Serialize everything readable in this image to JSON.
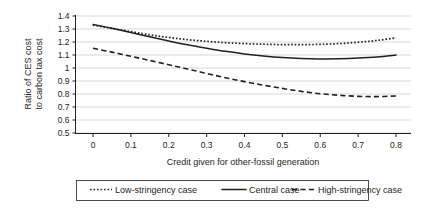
{
  "chart_data": {
    "type": "line",
    "title": "",
    "xlabel": "Credit given for other-fossil generation",
    "ylabel": "Ratio of CES cost to carbon tax cost",
    "ylabel_line1": "Ratio of CES cost",
    "ylabel_line2": "to carbon tax cost",
    "xlim": [
      0,
      0.8
    ],
    "ylim": [
      0.5,
      1.4
    ],
    "grid": true,
    "legend_position": "bottom",
    "x_ticks": [
      "0",
      "0.1",
      "0.2",
      "0.3",
      "0.4",
      "0.5",
      "0.6",
      "0.7",
      "0.8"
    ],
    "x_tick_values": [
      0,
      0.1,
      0.2,
      0.3,
      0.4,
      0.5,
      0.6,
      0.7,
      0.8
    ],
    "y_ticks": [
      "0.5",
      "0.6",
      "0.7",
      "0.8",
      "0.9",
      "1",
      "1.1",
      "1.2",
      "1.3",
      "1.4"
    ],
    "y_tick_values": [
      0.5,
      0.6,
      0.7,
      0.8,
      0.9,
      1.0,
      1.1,
      1.2,
      1.3,
      1.4
    ],
    "x": [
      0,
      0.05,
      0.1,
      0.15,
      0.2,
      0.25,
      0.3,
      0.35,
      0.4,
      0.45,
      0.5,
      0.55,
      0.6,
      0.65,
      0.7,
      0.75,
      0.8
    ],
    "series": [
      {
        "name": "Low-stringency case",
        "style": "dotted",
        "color": "#231f20",
        "values": [
          1.33,
          1.305,
          1.28,
          1.255,
          1.235,
          1.218,
          1.205,
          1.195,
          1.188,
          1.183,
          1.18,
          1.18,
          1.182,
          1.188,
          1.198,
          1.212,
          1.232
        ]
      },
      {
        "name": "Central case",
        "style": "solid",
        "color": "#231f20",
        "values": [
          1.335,
          1.305,
          1.273,
          1.24,
          1.208,
          1.178,
          1.152,
          1.128,
          1.108,
          1.092,
          1.08,
          1.073,
          1.07,
          1.071,
          1.076,
          1.085,
          1.1
        ]
      },
      {
        "name": "High-stringency case",
        "style": "dashed",
        "color": "#231f20",
        "values": [
          1.152,
          1.122,
          1.09,
          1.058,
          1.025,
          0.992,
          0.958,
          0.925,
          0.895,
          0.868,
          0.843,
          0.82,
          0.802,
          0.79,
          0.782,
          0.78,
          0.785
        ]
      }
    ]
  },
  "legend": {
    "items": [
      {
        "label": "Low-stringency case",
        "style": "dotted"
      },
      {
        "label": "Central case",
        "style": "solid"
      },
      {
        "label": "High-stringency case",
        "style": "dashed"
      }
    ]
  }
}
